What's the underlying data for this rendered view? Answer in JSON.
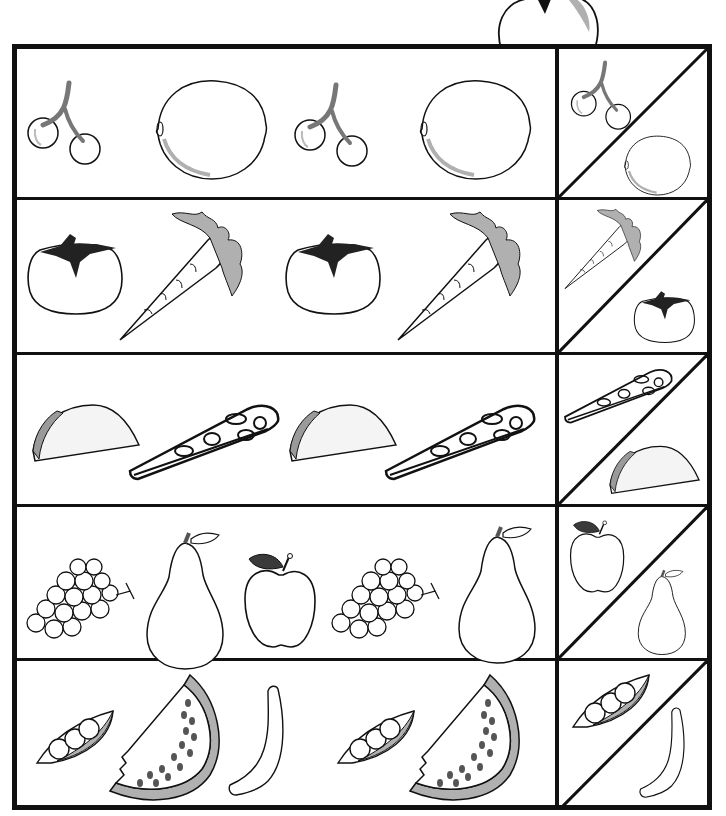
{
  "worksheet": {
    "title": "Pattern sequence worksheet - what comes next",
    "rows": [
      {
        "sequence": [
          "cherries",
          "lemon",
          "cherries",
          "lemon"
        ],
        "choices": [
          "cherries",
          "lemon"
        ]
      },
      {
        "sequence": [
          "tomato",
          "carrot",
          "tomato",
          "carrot"
        ],
        "choices": [
          "carrot",
          "tomato"
        ]
      },
      {
        "sequence": [
          "taco",
          "pizza",
          "taco",
          "pizza"
        ],
        "choices": [
          "pizza",
          "taco"
        ]
      },
      {
        "sequence": [
          "grapes",
          "pear",
          "apple",
          "grapes",
          "pear"
        ],
        "choices": [
          "apple",
          "pear"
        ]
      },
      {
        "sequence": [
          "peas",
          "watermelon",
          "banana",
          "peas",
          "watermelon"
        ],
        "choices": [
          "peas",
          "banana"
        ]
      }
    ],
    "decoration": "apple"
  },
  "colors": {
    "line": "#111111",
    "shade": "#b0b0b0",
    "leaf": "#3a3a3a",
    "background": "#ffffff"
  }
}
